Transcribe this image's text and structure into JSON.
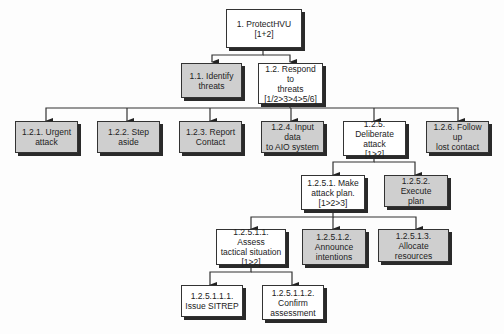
{
  "diagram": {
    "type": "hierarchical task analysis",
    "colors": {
      "leaf_fill": "#cfcfcf",
      "parent_fill": "#ffffff",
      "line": "#333333"
    },
    "nodes": [
      {
        "id": "1",
        "label": "1. ProtectHVU\n[1+2]",
        "style": "white"
      },
      {
        "id": "1.1",
        "label": "1.1. Identify\nthreats",
        "style": "gray"
      },
      {
        "id": "1.2",
        "label": "1.2. Respond to\nthreats\n[1/2>3>4>5/6]",
        "style": "white"
      },
      {
        "id": "1.2.1",
        "label": "1.2.1. Urgent\nattack",
        "style": "gray"
      },
      {
        "id": "1.2.2",
        "label": "1.2.2. Step aside",
        "style": "gray"
      },
      {
        "id": "1.2.3",
        "label": "1.2.3. Report\nContact",
        "style": "gray"
      },
      {
        "id": "1.2.4",
        "label": "1.2.4. Input data\nto AIO system",
        "style": "gray"
      },
      {
        "id": "1.2.5",
        "label": "1.2.5. Deliberate\nattack\n[1>2]",
        "style": "white"
      },
      {
        "id": "1.2.6",
        "label": "1.2.6. Follow up\nlost contact",
        "style": "gray"
      },
      {
        "id": "1.2.5.1",
        "label": "1.2.5.1. Make\nattack plan.\n[1>2>3]",
        "style": "white"
      },
      {
        "id": "1.2.5.2",
        "label": "1.2.5.2. Execute\nplan",
        "style": "gray"
      },
      {
        "id": "1.2.5.1.1",
        "label": "1.2.5.1.1. Assess\ntactical situation\n[1>2]",
        "style": "white"
      },
      {
        "id": "1.2.5.1.2",
        "label": "1.2.5.1.2.\nAnnounce\nintentions",
        "style": "gray"
      },
      {
        "id": "1.2.5.1.3",
        "label": "1.2.5.1.3.\nAllocate resources",
        "style": "gray"
      },
      {
        "id": "1.2.5.1.1.1",
        "label": "1.2.5.1.1.1.\nIssue SITREP",
        "style": "white"
      },
      {
        "id": "1.2.5.1.1.2",
        "label": "1.2.5.1.1.2.\nConfirm\nassessment",
        "style": "white"
      }
    ],
    "edges": [
      [
        "1",
        "1.1"
      ],
      [
        "1",
        "1.2"
      ],
      [
        "1.2",
        "1.2.1"
      ],
      [
        "1.2",
        "1.2.2"
      ],
      [
        "1.2",
        "1.2.3"
      ],
      [
        "1.2",
        "1.2.4"
      ],
      [
        "1.2",
        "1.2.5"
      ],
      [
        "1.2",
        "1.2.6"
      ],
      [
        "1.2.5",
        "1.2.5.1"
      ],
      [
        "1.2.5",
        "1.2.5.2"
      ],
      [
        "1.2.5.1",
        "1.2.5.1.1"
      ],
      [
        "1.2.5.1",
        "1.2.5.1.2"
      ],
      [
        "1.2.5.1",
        "1.2.5.1.3"
      ],
      [
        "1.2.5.1.1",
        "1.2.5.1.1.1"
      ],
      [
        "1.2.5.1.1",
        "1.2.5.1.1.2"
      ]
    ]
  }
}
